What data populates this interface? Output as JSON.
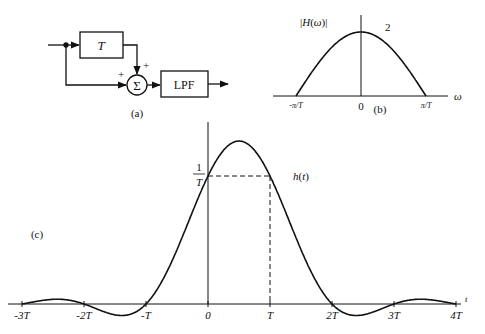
{
  "panel_a": {
    "caption": "(a)",
    "delay_block": "T",
    "summer_symbol": "Σ",
    "summer_inputs": [
      "+",
      "+"
    ],
    "filter_block": "LPF"
  },
  "panel_b": {
    "caption": "(b)",
    "ylabel": "|H(ω)|",
    "peak_label": "2",
    "xlabel": "ω",
    "ticks": [
      "-π/T",
      "0",
      "π/T"
    ]
  },
  "panel_c": {
    "caption": "(c)",
    "curve_label": "h(t)",
    "level_label_num": "1",
    "level_label_den": "T",
    "xlabel": "t",
    "ticks": [
      "-3T",
      "-2T",
      "-T",
      "0",
      "T",
      "2T",
      "3T",
      "4T"
    ]
  },
  "chart_data": [
    {
      "type": "line",
      "title": "(b) |H(ω)|",
      "xlabel": "ω",
      "ylabel": "|H(ω)|",
      "x_ticks": [
        "-π/T",
        "0",
        "π/T"
      ],
      "description": "Magnitude response 2cos(ωT/2) for |ω| ≤ π/T, zero outside",
      "x": [
        -1.0,
        -0.75,
        -0.5,
        -0.25,
        0,
        0.25,
        0.5,
        0.75,
        1.0
      ],
      "x_units": "π/T",
      "values": [
        0,
        0.77,
        1.41,
        1.85,
        2,
        1.85,
        1.41,
        0.77,
        0
      ],
      "annotations": [
        {
          "text": "2",
          "at": "peak"
        }
      ]
    },
    {
      "type": "line",
      "title": "(c) h(t)",
      "xlabel": "t",
      "ylabel": "h(t)",
      "x_ticks": [
        "-3T",
        "-2T",
        "-T",
        "0",
        "T",
        "2T",
        "3T",
        "4T"
      ],
      "x_units": "T",
      "x": [
        -3,
        -2.5,
        -2,
        -1.5,
        -1,
        -0.5,
        0,
        0.5,
        1,
        1.5,
        2,
        2.5,
        3,
        3.5,
        4
      ],
      "values": [
        0,
        0.085,
        0,
        -0.14,
        0,
        0.42,
        1.0,
        1.27,
        1.0,
        0.42,
        0,
        -0.14,
        0,
        0.085,
        0
      ],
      "y_units": "1/T",
      "annotations": [
        {
          "text": "1/T",
          "at": "dashed level at t=0 and t=T"
        }
      ],
      "dashed_guides": [
        {
          "from": [
            0,
            1
          ],
          "to": [
            1,
            1
          ]
        },
        {
          "from": [
            1,
            1
          ],
          "to": [
            1,
            0
          ]
        }
      ]
    }
  ]
}
